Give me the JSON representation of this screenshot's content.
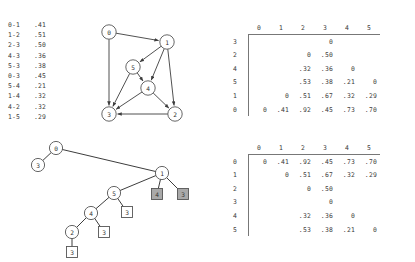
{
  "edge_list": {
    "title": "weighted-edge-list",
    "edges": [
      {
        "pair": "0-1",
        "weight": ".41"
      },
      {
        "pair": "1-2",
        "weight": ".51"
      },
      {
        "pair": "2-3",
        "weight": ".50"
      },
      {
        "pair": "4-3",
        "weight": ".36"
      },
      {
        "pair": "5-3",
        "weight": ".38"
      },
      {
        "pair": "0-3",
        "weight": ".45"
      },
      {
        "pair": "5-4",
        "weight": ".21"
      },
      {
        "pair": "1-4",
        "weight": ".32"
      },
      {
        "pair": "4-2",
        "weight": ".32"
      },
      {
        "pair": "1-5",
        "weight": ".29"
      }
    ]
  },
  "digraph": {
    "nodes": [
      {
        "id": "0",
        "cx": 23,
        "cy": 10
      },
      {
        "id": "1",
        "cx": 81,
        "cy": 20
      },
      {
        "id": "5",
        "cx": 47,
        "cy": 45
      },
      {
        "id": "4",
        "cx": 62,
        "cy": 66
      },
      {
        "id": "3",
        "cx": 23,
        "cy": 92
      },
      {
        "id": "2",
        "cx": 89,
        "cy": 92
      }
    ],
    "arcs": [
      {
        "from": "0",
        "to": "1"
      },
      {
        "from": "0",
        "to": "3"
      },
      {
        "from": "1",
        "to": "5"
      },
      {
        "from": "1",
        "to": "4"
      },
      {
        "from": "1",
        "to": "2"
      },
      {
        "from": "5",
        "to": "4"
      },
      {
        "from": "5",
        "to": "3"
      },
      {
        "from": "4",
        "to": "3"
      },
      {
        "from": "4",
        "to": "2"
      },
      {
        "from": "2",
        "to": "3"
      }
    ]
  },
  "tree": {
    "circle_nodes": [
      {
        "id": "0",
        "cx": 30,
        "cy": 8
      },
      {
        "id": "3",
        "cx": 12,
        "cy": 25
      },
      {
        "id": "1",
        "cx": 136,
        "cy": 33
      },
      {
        "id": "5",
        "cx": 88,
        "cy": 53
      },
      {
        "id": "4",
        "cx": 65,
        "cy": 73
      },
      {
        "id": "2",
        "cx": 46,
        "cy": 92
      }
    ],
    "square_leaves": [
      {
        "id": "4",
        "cx": 131,
        "cy": 54,
        "shaded": true
      },
      {
        "id": "3",
        "cx": 157,
        "cy": 54,
        "shaded": true
      },
      {
        "id": "3",
        "cx": 101,
        "cy": 72,
        "shaded": false
      },
      {
        "id": "3",
        "cx": 78,
        "cy": 92,
        "shaded": false
      },
      {
        "id": "3",
        "cx": 46,
        "cy": 112,
        "shaded": false
      }
    ],
    "links": [
      {
        "from_x": 30,
        "from_y": 8,
        "to_x": 12,
        "to_y": 25
      },
      {
        "from_x": 30,
        "from_y": 8,
        "to_x": 136,
        "to_y": 33
      },
      {
        "from_x": 136,
        "from_y": 33,
        "to_x": 88,
        "to_y": 53
      },
      {
        "from_x": 136,
        "from_y": 33,
        "to_x": 131,
        "to_y": 54
      },
      {
        "from_x": 136,
        "from_y": 33,
        "to_x": 157,
        "to_y": 54
      },
      {
        "from_x": 88,
        "from_y": 53,
        "to_x": 65,
        "to_y": 73
      },
      {
        "from_x": 88,
        "from_y": 53,
        "to_x": 101,
        "to_y": 72
      },
      {
        "from_x": 65,
        "from_y": 73,
        "to_x": 46,
        "to_y": 92
      },
      {
        "from_x": 65,
        "from_y": 73,
        "to_x": 78,
        "to_y": 92
      },
      {
        "from_x": 46,
        "from_y": 92,
        "to_x": 46,
        "to_y": 112
      }
    ]
  },
  "matrix_upper": {
    "name": "distance-matrix-sorted",
    "columns": [
      "0",
      "1",
      "2",
      "3",
      "4",
      "5"
    ],
    "rows": [
      {
        "label": "3",
        "cells": [
          "",
          "",
          "",
          "0",
          "",
          ""
        ]
      },
      {
        "label": "2",
        "cells": [
          "",
          "",
          "0",
          ".50",
          "",
          ""
        ]
      },
      {
        "label": "4",
        "cells": [
          "",
          "",
          ".32",
          ".36",
          "0",
          ""
        ]
      },
      {
        "label": "5",
        "cells": [
          "",
          "",
          ".53",
          ".38",
          ".21",
          "0"
        ]
      },
      {
        "label": "1",
        "cells": [
          "",
          "0",
          ".51",
          ".67",
          ".32",
          ".29"
        ]
      },
      {
        "label": "0",
        "cells": [
          "0",
          ".41",
          ".92",
          ".45",
          ".73",
          ".70"
        ]
      }
    ]
  },
  "matrix_lower": {
    "name": "distance-matrix-ordered",
    "columns": [
      "0",
      "1",
      "2",
      "3",
      "4",
      "5"
    ],
    "rows": [
      {
        "label": "0",
        "cells": [
          "0",
          ".41",
          ".92",
          ".45",
          ".73",
          ".70"
        ]
      },
      {
        "label": "1",
        "cells": [
          "",
          "0",
          ".51",
          ".67",
          ".32",
          ".29"
        ]
      },
      {
        "label": "2",
        "cells": [
          "",
          "",
          "0",
          ".50",
          "",
          ""
        ]
      },
      {
        "label": "3",
        "cells": [
          "",
          "",
          "",
          "0",
          "",
          ""
        ]
      },
      {
        "label": "4",
        "cells": [
          "",
          "",
          ".32",
          ".36",
          "0",
          ""
        ]
      },
      {
        "label": "5",
        "cells": [
          "",
          "",
          ".53",
          ".38",
          ".21",
          "0"
        ]
      }
    ]
  }
}
